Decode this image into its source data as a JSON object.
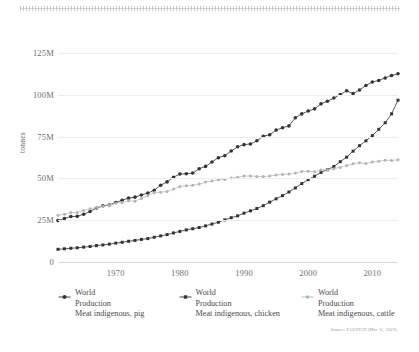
{
  "chart_data": {
    "type": "line",
    "title": "",
    "xlabel": "",
    "ylabel": "tonnes",
    "xlim": [
      1961,
      2014
    ],
    "ylim": [
      0,
      131000000
    ],
    "grid": true,
    "legend_position": "bottom",
    "y_ticks": [
      {
        "value": 0,
        "label": "0"
      },
      {
        "value": 25000000,
        "label": "25M"
      },
      {
        "value": 50000000,
        "label": "50M"
      },
      {
        "value": 75000000,
        "label": "75M"
      },
      {
        "value": 100000000,
        "label": "100M"
      },
      {
        "value": 125000000,
        "label": "125M"
      }
    ],
    "x_ticks": [
      {
        "value": 1970,
        "label": "1970"
      },
      {
        "value": 1980,
        "label": "1980"
      },
      {
        "value": 1990,
        "label": "1990"
      },
      {
        "value": 2000,
        "label": "2000"
      },
      {
        "value": 2010,
        "label": "2010"
      }
    ],
    "x": [
      1961,
      1962,
      1963,
      1964,
      1965,
      1966,
      1967,
      1968,
      1969,
      1970,
      1971,
      1972,
      1973,
      1974,
      1975,
      1976,
      1977,
      1978,
      1979,
      1980,
      1981,
      1982,
      1983,
      1984,
      1985,
      1986,
      1987,
      1988,
      1989,
      1990,
      1991,
      1992,
      1993,
      1994,
      1995,
      1996,
      1997,
      1998,
      1999,
      2000,
      2001,
      2002,
      2003,
      2004,
      2005,
      2006,
      2007,
      2008,
      2009,
      2010,
      2011,
      2012,
      2013,
      2014
    ],
    "series": [
      {
        "name": "World Production Meat indigenous, pig",
        "short_name": "pig",
        "color": "#333333",
        "marker": "filled-circle",
        "values": [
          24800000,
          26000000,
          27200000,
          27300000,
          28600000,
          30200000,
          32300000,
          33600000,
          34100000,
          35600000,
          36900000,
          38200000,
          38800000,
          40100000,
          41200000,
          42900000,
          45900000,
          47900000,
          50700000,
          52600000,
          52800000,
          53200000,
          55800000,
          57200000,
          59800000,
          62400000,
          63600000,
          66400000,
          68900000,
          70200000,
          70600000,
          72500000,
          75200000,
          76100000,
          78900000,
          80300000,
          81400000,
          86300000,
          88600000,
          90300000,
          91600000,
          94600000,
          96200000,
          98100000,
          100200000,
          102400000,
          100700000,
          102900000,
          105600000,
          107700000,
          108600000,
          110100000,
          111600000,
          112600000
        ]
      },
      {
        "name": "World Production Meat indigenous, chicken",
        "short_name": "chicken",
        "color": "#333333",
        "marker": "filled-square",
        "values": [
          7600000,
          7900000,
          8200000,
          8500000,
          8900000,
          9300000,
          9800000,
          10200000,
          10700000,
          11300000,
          11800000,
          12400000,
          12900000,
          13500000,
          14000000,
          14800000,
          15600000,
          16400000,
          17400000,
          18300000,
          19200000,
          19900000,
          20600000,
          21600000,
          22700000,
          23800000,
          25200000,
          26500000,
          27600000,
          29200000,
          30600000,
          32000000,
          33700000,
          35800000,
          37800000,
          39700000,
          41900000,
          44300000,
          46900000,
          49300000,
          51300000,
          53600000,
          55200000,
          57100000,
          60000000,
          62700000,
          66300000,
          69600000,
          72500000,
          75600000,
          79400000,
          83300000,
          88600000,
          96800000
        ]
      },
      {
        "name": "World Production Meat indigenous, cattle",
        "short_name": "cattle",
        "color": "#b3b3b3",
        "marker": "small-dot",
        "values": [
          28000000,
          28600000,
          29600000,
          29600000,
          30800000,
          31900000,
          32600000,
          33400000,
          34000000,
          35100000,
          35600000,
          36600000,
          36400000,
          38000000,
          39700000,
          41400000,
          41700000,
          42200000,
          43600000,
          45100000,
          45600000,
          45900000,
          46700000,
          47800000,
          48400000,
          49200000,
          49400000,
          50200000,
          50700000,
          51400000,
          51500000,
          51200000,
          51100000,
          51400000,
          52000000,
          52400000,
          52600000,
          53200000,
          54100000,
          54300000,
          54000000,
          55100000,
          55200000,
          55800000,
          56600000,
          57700000,
          58700000,
          59300000,
          58900000,
          59800000,
          60200000,
          60900000,
          60700000,
          61200000
        ]
      }
    ]
  },
  "legend": {
    "items": [
      {
        "line1": "World",
        "line2": "Production",
        "line3": "Meat indigenous, pig",
        "marker": "filled-circle",
        "color": "#333333"
      },
      {
        "line1": "World",
        "line2": "Production",
        "line3": "Meat indigenous, chicken",
        "marker": "filled-square",
        "color": "#333333"
      },
      {
        "line1": "World",
        "line2": "Production",
        "line3": "Meat indigenous, cattle",
        "marker": "small-dot",
        "color": "#b3b3b3"
      }
    ]
  },
  "source": {
    "text": "Source: FAOSTAT (Mar 11, 2019)"
  }
}
